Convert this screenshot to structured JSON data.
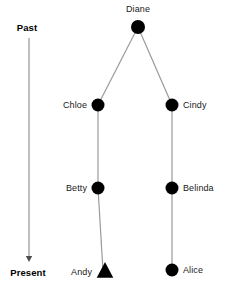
{
  "figure": {
    "width": 231,
    "height": 286,
    "background": "#ffffff",
    "node_color": "#000000",
    "edge_color": "#9a9a9a",
    "axis_color": "#8a8a8a",
    "text_color": "#1a1a1a"
  },
  "timeline_axis": {
    "top_label": "Past",
    "bottom_label": "Present",
    "top_label_x": 27,
    "top_label_y": 28,
    "bottom_label_x": 28,
    "bottom_label_y": 273,
    "line_x": 29,
    "line_y_start": 38,
    "line_y_end": 262,
    "arrow_direction": "down"
  },
  "tree": {
    "nodes": [
      {
        "id": "diane",
        "label": "Diane",
        "shape": "circle",
        "x": 138,
        "y": 27,
        "radius": 7,
        "label_x": 138,
        "label_y": 9,
        "label_position": "above"
      },
      {
        "id": "chloe",
        "label": "Chloe",
        "shape": "circle",
        "x": 98,
        "y": 105,
        "radius": 6.5,
        "label_x": 87,
        "label_y": 105,
        "label_position": "left"
      },
      {
        "id": "cindy",
        "label": "Cindy",
        "shape": "circle",
        "x": 172,
        "y": 105,
        "radius": 6.5,
        "label_x": 183,
        "label_y": 105,
        "label_position": "right"
      },
      {
        "id": "betty",
        "label": "Betty",
        "shape": "circle",
        "x": 98,
        "y": 188,
        "radius": 6.5,
        "label_x": 87,
        "label_y": 188,
        "label_position": "left"
      },
      {
        "id": "belinda",
        "label": "Belinda",
        "shape": "circle",
        "x": 172,
        "y": 188,
        "radius": 6.5,
        "label_x": 183,
        "label_y": 188,
        "label_position": "right"
      },
      {
        "id": "andy",
        "label": "Andy",
        "shape": "triangle",
        "x": 105,
        "y": 271,
        "radius": 9,
        "label_x": 92,
        "label_y": 272,
        "label_position": "left"
      },
      {
        "id": "alice",
        "label": "Alice",
        "shape": "circle",
        "x": 172,
        "y": 270,
        "radius": 6.5,
        "label_x": 183,
        "label_y": 270,
        "label_position": "right"
      }
    ],
    "edges": [
      {
        "id": "diane-chloe",
        "from": "diane",
        "to": "chloe",
        "x1": 138,
        "y1": 27,
        "x2": 98,
        "y2": 105
      },
      {
        "id": "diane-cindy",
        "from": "diane",
        "to": "cindy",
        "x1": 138,
        "y1": 27,
        "x2": 172,
        "y2": 105
      },
      {
        "id": "chloe-betty",
        "from": "chloe",
        "to": "betty",
        "x1": 98,
        "y1": 105,
        "x2": 98,
        "y2": 188
      },
      {
        "id": "betty-andy",
        "from": "betty",
        "to": "andy",
        "x1": 98,
        "y1": 188,
        "x2": 103,
        "y2": 271
      },
      {
        "id": "cindy-belinda",
        "from": "cindy",
        "to": "belinda",
        "x1": 172,
        "y1": 105,
        "x2": 172,
        "y2": 188
      },
      {
        "id": "belinda-alice",
        "from": "belinda",
        "to": "alice",
        "x1": 172,
        "y1": 188,
        "x2": 172,
        "y2": 270
      }
    ]
  }
}
